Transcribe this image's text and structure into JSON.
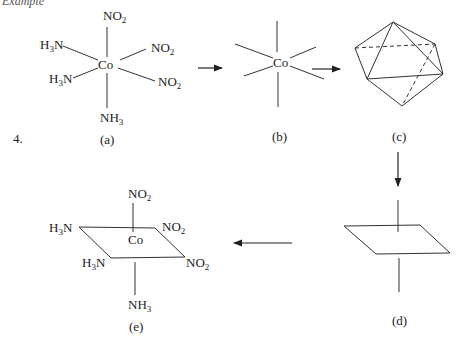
{
  "header": {
    "text": "Example"
  },
  "problem_number": "4.",
  "panels": {
    "a": {
      "label": "(a)",
      "center": "Co",
      "ligands": {
        "top": {
          "main": "NO",
          "sub": "2"
        },
        "upper_left": {
          "pre": "H",
          "sub": "3",
          "post": "N"
        },
        "upper_right": {
          "main": "NO",
          "sub": "2"
        },
        "lower_left": {
          "pre": "H",
          "sub": "3",
          "post": "N"
        },
        "lower_right": {
          "main": "NO",
          "sub": "2"
        },
        "bottom": {
          "main": "NH",
          "sub": "3"
        }
      }
    },
    "b": {
      "label": "(b)",
      "center": "Co"
    },
    "c": {
      "label": "(c)",
      "shape": "octahedron"
    },
    "d": {
      "label": "(d)",
      "shape": "square-plane-with-axis"
    },
    "e": {
      "label": "(e)",
      "center": "Co",
      "ligands": {
        "top": {
          "main": "NO",
          "sub": "2"
        },
        "back_left": {
          "pre": "H",
          "sub": "3",
          "post": "N"
        },
        "back_right": {
          "main": "NO",
          "sub": "2"
        },
        "front_left": {
          "pre": "H",
          "sub": "3",
          "post": "N"
        },
        "front_right": {
          "main": "NO",
          "sub": "2"
        },
        "bottom": {
          "main": "NH",
          "sub": "3"
        }
      }
    }
  },
  "arrows": [
    {
      "from": "a",
      "to": "b",
      "direction": "right"
    },
    {
      "from": "b",
      "to": "c",
      "direction": "right"
    },
    {
      "from": "c",
      "to": "d",
      "direction": "down"
    },
    {
      "from": "d",
      "to": "e",
      "direction": "left"
    }
  ]
}
